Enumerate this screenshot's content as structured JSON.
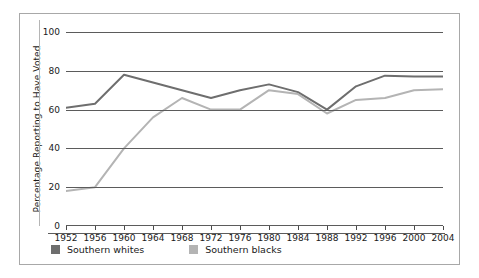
{
  "chart_data": {
    "type": "line",
    "title": "",
    "xlabel": "",
    "ylabel": "Percentage Reporting to Have Voted",
    "xlim": [
      1952,
      2004
    ],
    "ylim": [
      0,
      100
    ],
    "ytick_labels": [
      "0",
      "20",
      "40",
      "60",
      "80",
      "100"
    ],
    "yticks": [
      0,
      20,
      40,
      60,
      80,
      100
    ],
    "grid": true,
    "legend_position": "bottom-left",
    "categories": [
      1952,
      1956,
      1960,
      1964,
      1968,
      1972,
      1976,
      1980,
      1984,
      1988,
      1992,
      1996,
      2000,
      2004
    ],
    "x_tick_labels": [
      "1952",
      "1956",
      "1960",
      "1964",
      "1968",
      "1972",
      "1976",
      "1980",
      "1984",
      "1988",
      "1992",
      "1996",
      "2000",
      "2004"
    ],
    "series": [
      {
        "name": "Southern whites",
        "color": "#6e6e6e",
        "values": [
          61,
          63,
          78,
          74,
          70,
          66,
          70,
          73,
          69,
          60,
          72,
          77.5,
          77,
          77
        ]
      },
      {
        "name": "Southern blacks",
        "color": "#b4b4b4",
        "values": [
          18,
          20,
          40,
          56,
          66,
          60,
          60,
          70,
          68,
          58,
          65,
          66,
          70,
          70.5
        ]
      }
    ]
  },
  "legend": {
    "entries": [
      {
        "label": "Southern whites",
        "color": "#6e6e6e"
      },
      {
        "label": "Southern blacks",
        "color": "#b4b4b4"
      }
    ]
  },
  "colors": {
    "southern_whites": "#6e6e6e",
    "southern_blacks": "#b4b4b4",
    "gridline": "#5b5b5b",
    "frame_border": "#a8a8a8",
    "text": "#1a1a1a",
    "background": "#ffffff"
  }
}
